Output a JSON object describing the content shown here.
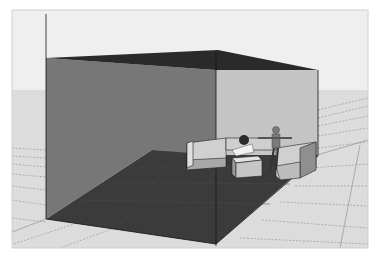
{
  "scene": {
    "description": "3D architectural render of an enclosed room with sectional sofa and two figures",
    "colors": {
      "sky": "#ececec",
      "ground": "#dcdcdc",
      "left_wall": "#777777",
      "back_wall": "#c4c4c4",
      "ceiling": "#2a2a2a",
      "floor": "#3a3a3a",
      "sofa": "#cfcfcf",
      "sofa_dark": "#8a8a8a",
      "grid_line": "#9a9a9a"
    },
    "objects": [
      {
        "name": "left-wall"
      },
      {
        "name": "back-wall"
      },
      {
        "name": "ceiling"
      },
      {
        "name": "floor"
      },
      {
        "name": "sectional-sofa"
      },
      {
        "name": "coffee-table"
      },
      {
        "name": "seated-figure"
      },
      {
        "name": "standing-figure"
      }
    ]
  }
}
